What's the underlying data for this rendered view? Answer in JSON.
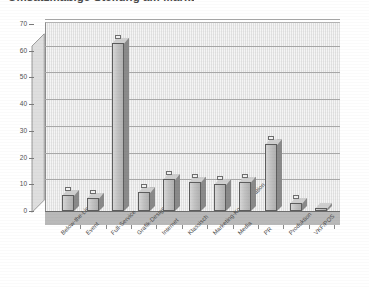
{
  "chart_data": {
    "type": "bar",
    "title": "Umsatzmäßige Stellung am Markt",
    "xlabel": "",
    "ylabel": "",
    "ylim": [
      0,
      70
    ],
    "yticks": [
      0,
      10,
      20,
      30,
      40,
      50,
      60,
      70
    ],
    "grid": true,
    "legend": "none",
    "style": "3d-column",
    "categories": [
      "Below-the-Line",
      "Event",
      "Full-Service",
      "Grafik-Design",
      "Internet",
      "Klassisch",
      "Marketing-Kommunikation",
      "Media",
      "PR",
      "Produktion",
      "VKF/POS"
    ],
    "values": [
      6,
      5,
      63,
      7,
      12,
      11,
      10,
      11,
      25,
      3,
      1
    ]
  },
  "colors": {
    "bar_face": "#c2c2c2",
    "bar_side": "#8a8a8a",
    "bar_outline": "#5d5d5d",
    "plot_background": "#e9e9e9",
    "floor": "#b9b9b9",
    "gridline": "#a8a8a8",
    "text": "#4d4d4d",
    "page_background": "#ffffff"
  }
}
